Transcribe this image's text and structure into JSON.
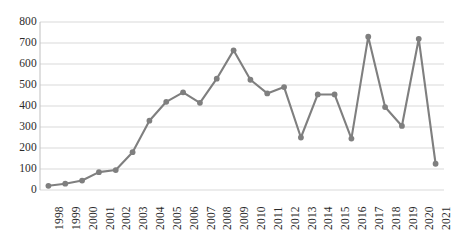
{
  "chart_data": {
    "type": "line",
    "title": "",
    "subtitle": "",
    "xlabel": "",
    "ylabel": "",
    "categories": [
      "1998",
      "1999",
      "2000",
      "2001",
      "2002",
      "2003",
      "2004",
      "2005",
      "2006",
      "2007",
      "2008",
      "2009",
      "2010",
      "2011",
      "2012",
      "2013",
      "2014",
      "2015",
      "2016",
      "2017",
      "2018",
      "2019",
      "2020",
      "2021"
    ],
    "values": [
      20,
      30,
      45,
      85,
      95,
      180,
      330,
      420,
      465,
      415,
      530,
      665,
      525,
      460,
      490,
      250,
      455,
      455,
      245,
      730,
      395,
      305,
      720,
      125
    ],
    "series": [
      {
        "name": "Series 1",
        "values": [
          20,
          30,
          45,
          85,
          95,
          180,
          330,
          420,
          465,
          415,
          530,
          665,
          525,
          460,
          490,
          250,
          455,
          455,
          245,
          730,
          395,
          305,
          720,
          125
        ]
      }
    ],
    "ylim": [
      0,
      800
    ],
    "yticks": [
      0,
      100,
      200,
      300,
      400,
      500,
      600,
      700,
      800
    ],
    "ytick_labels": [
      "0",
      "100",
      "200",
      "300",
      "400",
      "500",
      "600",
      "700",
      "800"
    ],
    "grid": true,
    "grid_axis": "y",
    "legend": false,
    "legend_position": "none",
    "marker": "circle",
    "colors": {
      "line": "#7f7f7f",
      "marker": "#7f7f7f",
      "grid": "#d9d9d9",
      "axis": "#bfbfbf",
      "tick_text": "#2b2b2b",
      "background": "#ffffff"
    },
    "annotations": []
  },
  "geometry": {
    "plot_left": 40,
    "plot_right": 444,
    "plot_top": 22,
    "plot_bottom": 190
  }
}
